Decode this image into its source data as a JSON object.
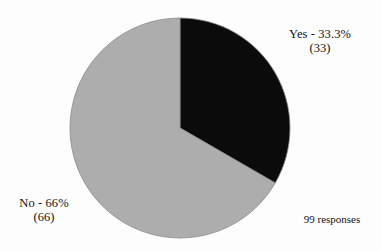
{
  "chart_data": {
    "type": "pie",
    "title": "",
    "subtitle": "",
    "xlabel": "",
    "ylabel": "",
    "legend_position": "none",
    "grid": false,
    "total_label": "99 responses",
    "total": 99,
    "start_angle_deg": 0,
    "direction": "clockwise",
    "center": {
      "cx": 180,
      "cy": 128
    },
    "radius": 110,
    "categories": [
      "Yes",
      "No"
    ],
    "values": [
      33,
      66
    ],
    "percentages": [
      33.3,
      66
    ],
    "colors": [
      "#0b0b0b",
      "#adadad"
    ],
    "slices": [
      {
        "name": "Yes",
        "value": 33,
        "percent": 33.3,
        "color": "#0b0b0b",
        "start_deg": 0,
        "end_deg": 120,
        "label_line1": "Yes - 33.3%",
        "label_line2": "(33)"
      },
      {
        "name": "No",
        "value": 66,
        "percent": 66,
        "color": "#adadad",
        "start_deg": 120,
        "end_deg": 360,
        "label_line1": "No - 66%",
        "label_line2": "(66)"
      }
    ]
  },
  "labels": {
    "yes": {
      "line1": "Yes - 33.3%",
      "line2": "(33)"
    },
    "no": {
      "line1": "No - 66%",
      "line2": "(66)"
    },
    "responses": "99 responses"
  },
  "colors": {
    "background": "#fdfdfd",
    "slice_yes": "#0b0b0b",
    "slice_no": "#adadad",
    "slice_outline": "#8a8a8a",
    "text": "#121212"
  }
}
